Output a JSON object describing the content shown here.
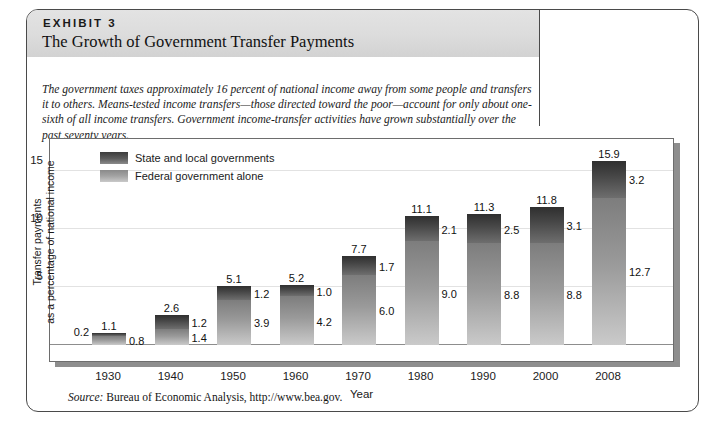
{
  "exhibit": {
    "kicker": "EXHIBIT 3",
    "title": "The Growth of Government Transfer Payments",
    "description": "The government taxes approximately 16 percent of national income away from some people and transfers it to others. Means-tested income transfers—those directed toward the poor—account for only about one-sixth of all income transfers. Government income-transfer activities have grown substantially over the past seventy years.",
    "source_prefix": "Source:",
    "source_text": " Bureau of Economic Analysis, http://www.bea.gov."
  },
  "chart_data": {
    "type": "bar",
    "title": "The Growth of Government Transfer Payments",
    "xlabel": "Year",
    "ylabel": "Transfer payments as a percentage of national income",
    "ylabel_line1": "Transfer payments",
    "ylabel_line2": "as a percentage of national income",
    "categories": [
      "1930",
      "1940",
      "1950",
      "1960",
      "1970",
      "1980",
      "1990",
      "2000",
      "2008"
    ],
    "yticks": [
      5,
      10,
      15
    ],
    "ylim": [
      0,
      17.6
    ],
    "grid": true,
    "stacked": true,
    "legend_position": "top-left",
    "series": [
      {
        "name": "Federal government alone",
        "color": "#9a9a9a",
        "values": [
          0.8,
          1.4,
          3.9,
          4.2,
          6.0,
          9.0,
          8.8,
          8.8,
          12.7
        ]
      },
      {
        "name": "State and local governments",
        "color": "#464646",
        "values": [
          0.2,
          1.2,
          1.2,
          1.0,
          1.7,
          2.1,
          2.5,
          3.1,
          3.2
        ]
      }
    ],
    "totals": [
      1.1,
      2.6,
      5.1,
      5.2,
      7.7,
      11.1,
      11.3,
      11.8,
      15.9
    ],
    "total_labels": [
      "1.1",
      "2.6",
      "5.1",
      "5.2",
      "7.7",
      "11.1",
      "11.3",
      "11.8",
      "15.9"
    ],
    "state_labels": [
      "0.2",
      "1.2",
      "1.2",
      "1.0",
      "1.7",
      "2.1",
      "2.5",
      "3.1",
      "3.2"
    ],
    "federal_labels": [
      "0.8",
      "1.4",
      "3.9",
      "4.2",
      "6.0",
      "9.0",
      "8.8",
      "8.8",
      "12.7"
    ]
  },
  "legend": [
    {
      "label": "State and local governments"
    },
    {
      "label": "Federal government alone"
    }
  ]
}
